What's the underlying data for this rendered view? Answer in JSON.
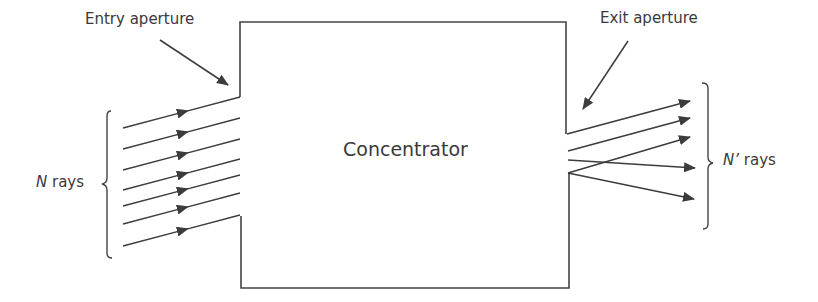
{
  "labels": {
    "entry_aperture": "Entry aperture",
    "exit_aperture": "Exit aperture",
    "concentrator": "Concentrator",
    "input_rays_symbol": "N",
    "input_rays_word": " rays",
    "output_rays_symbol": "N’",
    "output_rays_word": " rays"
  },
  "colors": {
    "stroke": "#3c3c3c",
    "text": "#3a3a3a",
    "background": "#ffffff"
  },
  "diagram": {
    "concentrator_box": {
      "left": 240,
      "right": 567,
      "top": 22,
      "bottom": 288
    },
    "entry_aperture": {
      "x": 240,
      "y_top": 97,
      "y_bottom": 216
    },
    "exit_aperture": {
      "x": 567,
      "y_top": 134,
      "y_bottom": 173
    },
    "input_ray_count": 7,
    "output_ray_count": 5
  }
}
